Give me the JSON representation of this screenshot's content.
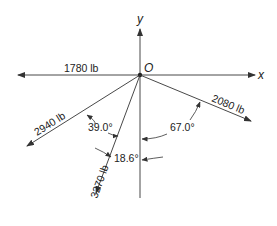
{
  "diagram": {
    "origin_label": "O",
    "x_axis_label": "x",
    "y_axis_label": "y",
    "forces": [
      {
        "id": "f1",
        "label": "1780 lb",
        "direction": "negative x-axis"
      },
      {
        "id": "f2",
        "label": "2080 lb",
        "angle_label": "67.0°",
        "angle_reference": "negative y-axis, toward +x"
      },
      {
        "id": "f3",
        "label": "2940 lb",
        "angle_label": "39.0°",
        "angle_reference": "from 3270 lb force"
      },
      {
        "id": "f4",
        "label": "3270 lb",
        "angle_label": "18.6°",
        "angle_reference": "negative y-axis, toward -x"
      }
    ],
    "angles": {
      "a1": "39.0°",
      "a2": "67.0°",
      "a3": "18.6°"
    },
    "colors": {
      "line": "#333333",
      "background": "#ffffff"
    }
  }
}
